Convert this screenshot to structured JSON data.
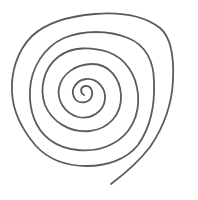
{
  "image": {
    "subject": "hand-drawn spiral",
    "background_color": "#ffffff",
    "stroke_color": "#5c5c5c",
    "stroke_width": 1.8,
    "center": [
      84,
      95
    ],
    "turns": 5,
    "spiral_path": "M84 95 C 80 93, 80 87, 85 86 C 91 85, 94 92, 91 98 C 87 104, 77 104, 74 97 C 70 89, 77 80, 86 79 C 98 78, 106 89, 105 99 C 104 112, 90 120, 78 117 C 64 113, 57 100, 59 88 C 62 73, 77 64, 92 64 C 109 64, 120 78, 121 95 C 122 115, 108 129, 90 131 C 70 133, 52 122, 45 105 C 39 88, 44 68, 58 57 C 72 46, 92 47, 108 52 C 125 58, 136 74, 138 94 C 140 116, 130 135, 112 144 C 93 154, 66 152, 50 140 C 35 129, 29 110, 30 90 C 31 68, 44 47, 64 38 C 84 30, 108 30, 128 38 C 146 45, 154 62, 154 82 C 155 106, 150 128, 138 145 C 126 160, 106 166, 87 166 C 68 166, 49 160, 36 146 C 24 132, 13 114, 12 92 C 11 72, 17 51, 32 36 C 47 22, 70 16, 95 14 C 120 12, 143 15, 160 28 C 172 38, 174 58, 173 80 C 172 104, 163 128, 150 147 C 140 160, 127 172, 111 184"
  }
}
